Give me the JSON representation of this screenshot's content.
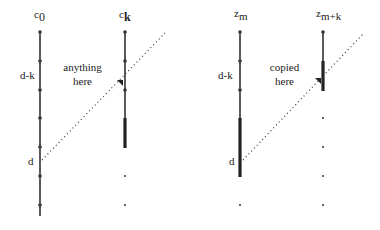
{
  "diagram": {
    "left_panel": {
      "column_a": {
        "base": "c",
        "subscript": "0"
      },
      "column_b": {
        "base": "c",
        "subscript": "k"
      },
      "interval_label": "d-k",
      "point_label": "d",
      "note_line1": "anything",
      "note_line2": "here"
    },
    "right_panel": {
      "column_a": {
        "base": "z",
        "subscript": "m"
      },
      "column_b": {
        "base": "z",
        "subscript": "m+k"
      },
      "interval_label": "d-k",
      "point_label": "d",
      "note_line1": "copied",
      "note_line2": "here"
    },
    "colors": {
      "line": "#333333",
      "background": "#ffffff"
    }
  }
}
